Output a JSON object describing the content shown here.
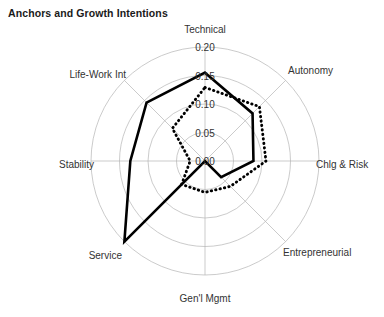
{
  "chart_data": {
    "type": "radar",
    "title": "Anchors and Growth Intentions",
    "categories": [
      "Technical",
      "Autonomy",
      "Chlg & Risk",
      "Entrepreneurial",
      "Gen'l Mgmt",
      "Service",
      "Stability",
      "Life-Work Int"
    ],
    "tick_labels": [
      "0.00",
      "0.05",
      "0.10",
      "0.15",
      "0.20"
    ],
    "tick_values": [
      0.0,
      0.05,
      0.1,
      0.15,
      0.2
    ],
    "rlim": [
      0.0,
      0.2
    ],
    "grid": true,
    "legend": "none",
    "xlabel": "",
    "ylabel": "",
    "series": [
      {
        "name": "solid",
        "style": "solid",
        "color": "#000000",
        "values": [
          0.155,
          0.118,
          0.085,
          0.04,
          0.0,
          0.2,
          0.131,
          0.145
        ]
      },
      {
        "name": "dotted",
        "style": "dotted",
        "color": "#000000",
        "values": [
          0.129,
          0.135,
          0.107,
          0.063,
          0.055,
          0.058,
          0.026,
          0.081
        ]
      }
    ]
  },
  "labels": {
    "technical": "Technical",
    "autonomy": "Autonomy",
    "chlg_risk": "Chlg & Risk",
    "entrepreneurial": "Entrepreneurial",
    "genl_mgmt": "Gen'l Mgmt",
    "service": "Service",
    "stability": "Stability",
    "life_work": "Life-Work Int"
  },
  "ticks": {
    "t0": "0.00",
    "t1": "0.05",
    "t2": "0.10",
    "t3": "0.15",
    "t4": "0.20"
  }
}
